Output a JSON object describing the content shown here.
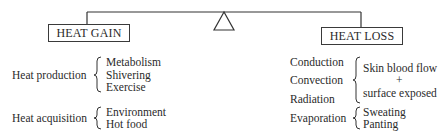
{
  "diagram": {
    "type": "balance",
    "heat_gain": {
      "title": "HEAT GAIN",
      "groups": [
        {
          "label": "Heat production",
          "items": [
            "Metabolism",
            "Shivering",
            "Exercise"
          ]
        },
        {
          "label": "Heat acquisition",
          "items": [
            "Environment",
            "Hot food"
          ]
        }
      ]
    },
    "heat_loss": {
      "title": "HEAT LOSS",
      "mechanisms": [
        "Conduction",
        "Convection",
        "Radiation",
        "Evaporation"
      ],
      "convection_group": {
        "items": [
          "Skin blood flow",
          "+",
          "surface exposed"
        ]
      },
      "evaporation_group": {
        "items": [
          "Sweating",
          "Panting"
        ]
      }
    },
    "colors": {
      "ink": "#2a2a2a",
      "background": "#ffffff"
    }
  }
}
